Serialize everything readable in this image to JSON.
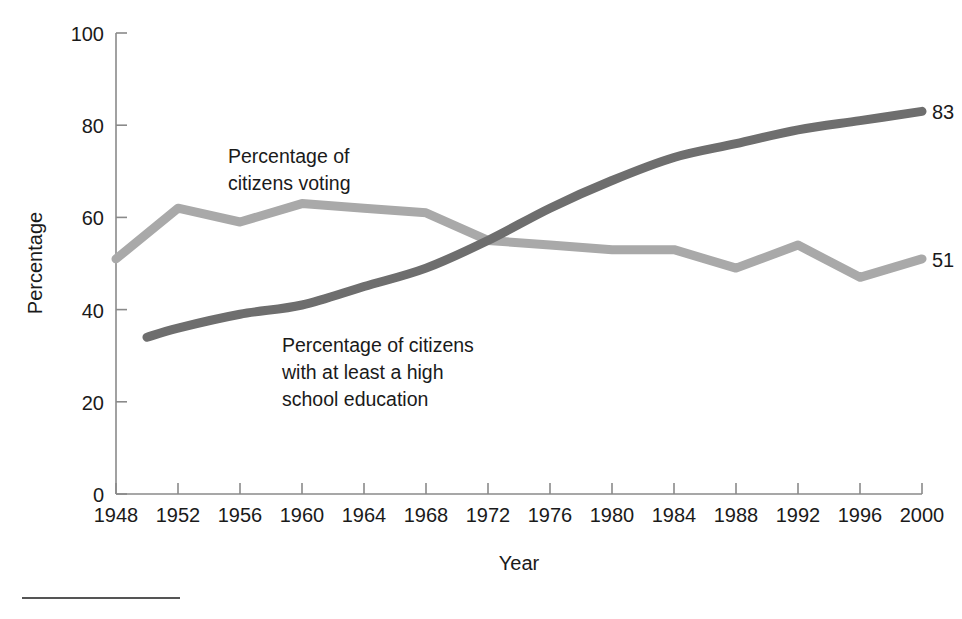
{
  "chart_data": {
    "type": "line",
    "title": "",
    "xlabel": "Year",
    "ylabel": "Percentage",
    "xlim": [
      1948,
      2000
    ],
    "ylim": [
      0,
      100
    ],
    "grid": false,
    "legend_position": "inline-annotations",
    "x": [
      1948,
      1952,
      1956,
      1960,
      1964,
      1968,
      1972,
      1976,
      1980,
      1984,
      1988,
      1992,
      1996,
      2000
    ],
    "xticklabels": [
      "1948",
      "1952",
      "1956",
      "1960",
      "1964",
      "1968",
      "1972",
      "1976",
      "1980",
      "1984",
      "1988",
      "1992",
      "1996",
      "2000"
    ],
    "yticks": [
      0,
      20,
      40,
      60,
      80,
      100
    ],
    "yticklabels": [
      "0",
      "20",
      "40",
      "60",
      "80",
      "100"
    ],
    "series": [
      {
        "name": "Percentage of citizens voting",
        "color": "#a9a9a9",
        "x": [
          1948,
          1952,
          1956,
          1960,
          1964,
          1968,
          1972,
          1976,
          1980,
          1984,
          1988,
          1992,
          1996,
          2000
        ],
        "values": [
          51,
          62,
          59,
          63,
          62,
          61,
          55,
          54,
          53,
          53,
          49,
          54,
          47,
          51
        ],
        "end_label": "51"
      },
      {
        "name": "Percentage of citizens with at least a high school education",
        "color": "#6e6e6e",
        "x": [
          1950,
          1952,
          1956,
          1960,
          1964,
          1968,
          1972,
          1976,
          1980,
          1984,
          1988,
          1992,
          1996,
          2000
        ],
        "values": [
          34,
          36,
          39,
          41,
          45,
          49,
          55,
          62,
          68,
          73,
          76,
          79,
          81,
          83
        ],
        "end_label": "83"
      }
    ],
    "annotations": [
      {
        "id": "voting-annotation",
        "lines": [
          "Percentage of",
          "citizens voting"
        ],
        "x": 1955.5,
        "y": 73
      },
      {
        "id": "education-annotation",
        "lines": [
          "Percentage of citizens",
          "with at least a high",
          "school education"
        ],
        "x": 1961.0,
        "y": 32
      }
    ]
  },
  "axes": {
    "y_title": "Percentage",
    "x_title": "Year"
  },
  "end_labels": {
    "education": "83",
    "voting": "51"
  },
  "ticks": {
    "y": [
      "100",
      "80",
      "60",
      "40",
      "20",
      "0"
    ],
    "x": [
      "1948",
      "1952",
      "1956",
      "1960",
      "1964",
      "1968",
      "1972",
      "1976",
      "1980",
      "1984",
      "1988",
      "1992",
      "1996",
      "2000"
    ]
  },
  "annotation_text": {
    "voting_line1": "Percentage of",
    "voting_line2": "citizens voting",
    "education_line1": "Percentage of citizens",
    "education_line2": "with at least a high",
    "education_line3": "school education"
  }
}
